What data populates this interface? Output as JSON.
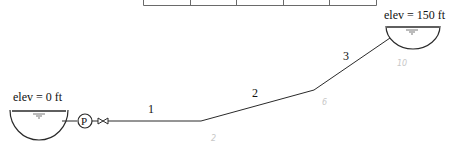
{
  "table": {
    "columns": 5,
    "cells": [
      "",
      "",
      "",
      "",
      ""
    ]
  },
  "reservoirs": [
    {
      "id": "left",
      "label": "elev = 0 ft"
    },
    {
      "id": "right",
      "label": "elev = 150 ft"
    }
  ],
  "pump": {
    "symbol": "P"
  },
  "pipes": [
    {
      "label": "1"
    },
    {
      "label": "2"
    },
    {
      "label": "3"
    }
  ],
  "pencil_marks": [
    {
      "text": "2"
    },
    {
      "text": "6"
    },
    {
      "text": "10"
    }
  ],
  "colors": {
    "line": "#2a2a2a",
    "table_line": "#6a6a6a",
    "water": "#555555",
    "pencil": "#c8c8c8"
  }
}
